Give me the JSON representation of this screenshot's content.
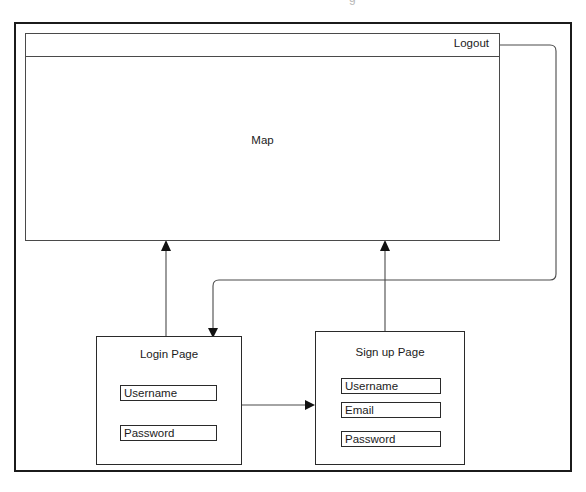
{
  "diagram": {
    "type": "ui-flow-wireframe",
    "clipped_top_glyph": "g",
    "map_window": {
      "titlebar": {
        "logout_label": "Logout"
      },
      "body_label": "Map"
    },
    "pages": [
      {
        "id": "login",
        "title": "Login Page",
        "fields": [
          {
            "label": "Username"
          },
          {
            "label": "Password"
          }
        ]
      },
      {
        "id": "signup",
        "title": "Sign up Page",
        "fields": [
          {
            "label": "Username"
          },
          {
            "label": "Email"
          },
          {
            "label": "Password"
          }
        ]
      }
    ],
    "connectors": [
      {
        "id": "logout-to-login",
        "from": "Logout",
        "to": "Login Page",
        "arrow": "down"
      },
      {
        "id": "login-to-map",
        "from": "Login Page",
        "to": "Map",
        "arrow": "up"
      },
      {
        "id": "signup-to-map",
        "from": "Sign up Page",
        "to": "Map",
        "arrow": "up"
      },
      {
        "id": "login-to-signup",
        "from": "Login Page",
        "to": "Sign up Page",
        "arrow": "right"
      }
    ],
    "colors": {
      "outer_border": "#1b1b1b",
      "box_border": "#2a2a2a",
      "connector": "#4a4a4a",
      "text": "#1b1b1b",
      "background": "#ffffff"
    }
  }
}
